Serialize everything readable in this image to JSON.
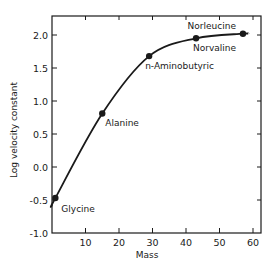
{
  "chart_data": {
    "type": "line",
    "title": "",
    "xlabel": "Mass",
    "ylabel": "Log velocity constant",
    "xlim": [
      0,
      62
    ],
    "ylim": [
      -1.0,
      2.25
    ],
    "xticks": [
      10,
      20,
      30,
      40,
      50,
      60
    ],
    "xtick_labels": [
      "10",
      "20",
      "30",
      "40",
      "50",
      "60"
    ],
    "yticks": [
      -1.0,
      -0.5,
      0.0,
      0.5,
      1.0,
      1.5,
      2.0
    ],
    "ytick_labels": [
      "-1.0",
      "-0.5",
      "0.0",
      "0.5",
      "1.0",
      "1.5",
      "2.0"
    ],
    "grid": false,
    "legend": null,
    "series": [
      {
        "name": "Amino acids",
        "color": "#1a1a1a",
        "points": [
          {
            "label": "Glycine",
            "x": 1,
            "y": -0.47
          },
          {
            "label": "Alanine",
            "x": 15,
            "y": 0.81
          },
          {
            "label": "n-Aminobutyric",
            "x": 29,
            "y": 1.68
          },
          {
            "label": "Norvaline",
            "x": 43,
            "y": 1.95
          },
          {
            "label": "Norleucine",
            "x": 57,
            "y": 2.02
          }
        ]
      }
    ],
    "annotations": [
      "Glycine",
      "Alanine",
      "n-Aminobutyric",
      "Norvaline",
      "Norleucine"
    ]
  },
  "plot_area": {
    "left": 52,
    "right": 261,
    "top": 16,
    "bottom": 233
  }
}
